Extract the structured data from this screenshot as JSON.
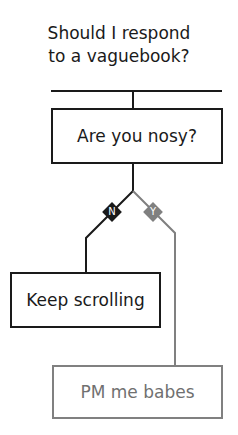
{
  "title": {
    "line1": "Should I respond",
    "line2": "to a vaguebook?"
  },
  "nodes": {
    "question": "Are you nosy?",
    "no_outcome": "Keep scrolling",
    "yes_outcome": "PM me babes"
  },
  "branches": {
    "no": "N",
    "yes": "Y"
  },
  "colors": {
    "dark": "#1a1a1a",
    "grey": "#808080"
  }
}
